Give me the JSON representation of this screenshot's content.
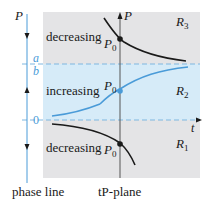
{
  "colors": {
    "gray_region": "#e4e4e6",
    "blue_region": "#d6ebf8",
    "blue_line": "#4a9bd8",
    "black": "#1a1a1a",
    "dashed": "#7fb7e0"
  },
  "phase_line": {
    "axis_label": "P",
    "level_a": "a",
    "level_b": "b",
    "level_zero": "0",
    "caption": "phase line"
  },
  "tp_plane": {
    "y_axis_label": "P",
    "x_axis_label": "t",
    "caption": "tP-plane",
    "regions": [
      {
        "name": "R3",
        "main": "R",
        "sub": "3",
        "behavior": "decreasing"
      },
      {
        "name": "R2",
        "main": "R",
        "sub": "2",
        "behavior": "increasing"
      },
      {
        "name": "R1",
        "main": "R",
        "sub": "1",
        "behavior": "decreasing"
      }
    ],
    "initial_point_label": "P",
    "initial_point_sub": "0"
  }
}
